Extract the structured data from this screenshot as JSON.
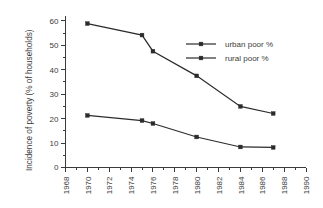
{
  "chart_data": {
    "type": "line",
    "title": "",
    "xlabel": "",
    "ylabel": "Incidence of poverty (% of households)",
    "xlim": [
      1968,
      1990
    ],
    "ylim": [
      0,
      62
    ],
    "grid": false,
    "legend_position": "upper-right-inside",
    "x_ticks": [
      "1968",
      "1970",
      "1972",
      "1974",
      "1976",
      "1978",
      "1980",
      "1982",
      "1984",
      "1986",
      "1988",
      "1990"
    ],
    "x_tick_values": [
      1968,
      1970,
      1972,
      1974,
      1976,
      1978,
      1980,
      1982,
      1984,
      1986,
      1988,
      1990
    ],
    "y_ticks": [
      "0",
      "10",
      "20",
      "30",
      "40",
      "50",
      "60"
    ],
    "y_tick_values": [
      0,
      10,
      20,
      30,
      40,
      50,
      60
    ],
    "x": [
      1970,
      1975,
      1976,
      1980,
      1984,
      1987
    ],
    "series": [
      {
        "name": "urban poor %",
        "values": [
          21.3,
          19.2,
          18.0,
          12.5,
          8.4,
          8.2
        ],
        "color": "#2b2b2b",
        "marker": "square"
      },
      {
        "name": "rural poor %",
        "values": [
          58.9,
          54.2,
          47.6,
          37.5,
          25.0,
          22.1
        ],
        "color": "#2b2b2b",
        "marker": "square"
      }
    ],
    "legend": [
      {
        "label": "urban poor %"
      },
      {
        "label": "rural poor %"
      }
    ]
  }
}
